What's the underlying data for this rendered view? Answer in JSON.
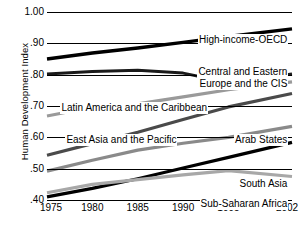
{
  "chart_data": {
    "type": "line",
    "title": "",
    "xlabel": "",
    "ylabel": "Human Development Index",
    "x": [
      1975,
      1980,
      1985,
      1990,
      1995,
      2002
    ],
    "xtick_labels": [
      "1975",
      "1980",
      "1985",
      "1990",
      "1995",
      "2002"
    ],
    "ytick_labels": [
      "1.00",
      ".90",
      ".80",
      ".70",
      ".60",
      ".50",
      ".40"
    ],
    "ytick_values": [
      1.0,
      0.9,
      0.8,
      0.7,
      0.6,
      0.5,
      0.4
    ],
    "ylim": [
      0.4,
      1.0
    ],
    "xlim": [
      1975,
      2002
    ],
    "grid": true,
    "legend": "inline-labels",
    "series": [
      {
        "name": "High-income-OECD",
        "color": "#000000",
        "width": 3.4,
        "values": [
          0.85,
          0.869,
          0.885,
          0.903,
          0.922,
          0.946
        ]
      },
      {
        "name": "Central and Eastern Europe and the CIS",
        "color": "#1a1a1a",
        "width": 3.0,
        "values": [
          0.802,
          0.81,
          0.814,
          0.805,
          0.775,
          0.802
        ]
      },
      {
        "name": "Latin America and the Caribbean",
        "color": "#9a9a9a",
        "width": 3.2,
        "values": [
          0.668,
          0.696,
          0.707,
          0.729,
          0.752,
          0.777
        ]
      },
      {
        "name": "East Asia and the Pacific",
        "color": "#4a4a4a",
        "width": 3.2,
        "values": [
          0.543,
          0.58,
          0.616,
          0.657,
          0.697,
          0.74
        ]
      },
      {
        "name": "Arab States",
        "color": "#8a8a8a",
        "width": 3.2,
        "values": [
          0.492,
          0.527,
          0.559,
          0.581,
          0.6,
          0.635
        ]
      },
      {
        "name": "South Asia",
        "color": "#000000",
        "width": 3.2,
        "values": [
          0.41,
          0.437,
          0.468,
          0.502,
          0.536,
          0.584
        ]
      },
      {
        "name": "Sub-Saharan Africa",
        "color": "#a8a8a8",
        "width": 3.2,
        "values": [
          0.423,
          0.45,
          0.465,
          0.48,
          0.494,
          0.475
        ]
      }
    ],
    "annotations": [
      {
        "text": "High-income-OECD",
        "x_frac": 0.985,
        "y_px": 22,
        "align": "right"
      },
      {
        "text": "Central and Eastern",
        "x_frac": 0.985,
        "y_px": 54,
        "align": "right"
      },
      {
        "text": "Europe and the CIS",
        "x_frac": 0.985,
        "y_px": 66,
        "align": "right"
      },
      {
        "text": "Latin America and the Caribbean",
        "x_frac": 0.055,
        "y_px": 90,
        "align": "left"
      },
      {
        "text": "East Asia and the Pacific",
        "x_frac": 0.075,
        "y_px": 122,
        "align": "left"
      },
      {
        "text": "Arab States",
        "x_frac": 0.985,
        "y_px": 122,
        "align": "right"
      },
      {
        "text": "South Asia",
        "x_frac": 0.985,
        "y_px": 166,
        "align": "right"
      },
      {
        "text": "Sub-Saharan Africa",
        "x_frac": 0.985,
        "y_px": 186,
        "align": "right"
      }
    ]
  }
}
